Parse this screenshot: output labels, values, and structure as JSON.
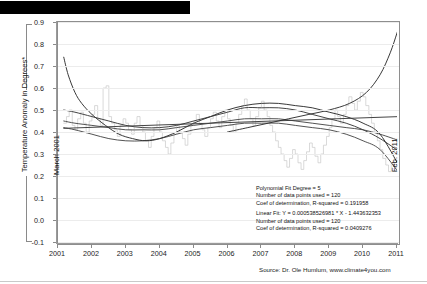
{
  "page": {
    "redaction_bar": "redacted-title-bar",
    "source_note": "Source: Dr. Ole Humlum, www.climate4you.com"
  },
  "chart_data": {
    "type": "line",
    "title": "",
    "xlabel": "",
    "ylabel": "Temperature Anomaly in Degrees*",
    "xlim": [
      2001,
      2011
    ],
    "ylim": [
      -0.1,
      0.9
    ],
    "grid": true,
    "legend_position": "inside-lower-right",
    "xticks": [
      "2001",
      "2002",
      "2003",
      "2004",
      "2005",
      "2006",
      "2007",
      "2008",
      "2009",
      "2010",
      "2011"
    ],
    "yticks": [
      "0.9",
      "0.8",
      "0.7",
      "0.6",
      "0.5",
      "0.4",
      "0.3",
      "0.2",
      "0.1",
      "0.0",
      "-0.1"
    ],
    "annotations": {
      "start_label": "March 2001",
      "end_label": "Feb. 2011"
    },
    "fit_info": {
      "polynomial": {
        "degree_line": "Polynomial Fit Degree = 5",
        "points_line": "Number of data points used = 120",
        "r2_line": "Coef of determination, R-squared = 0.191958"
      },
      "linear": {
        "equation_line": "Linear Fit: Y = 0.000538526981 * X - 1.443632353",
        "points_line": "Number of data points used = 120",
        "r2_line": "Coef of determination, R-squared = 0.0409276"
      }
    },
    "series": [
      {
        "name": "Monthly temperature anomaly",
        "style": "step",
        "color": "#c9c9c9",
        "x": [
          2001.17,
          2001.25,
          2001.33,
          2001.42,
          2001.5,
          2001.58,
          2001.67,
          2001.75,
          2001.83,
          2001.92,
          2002.0,
          2002.08,
          2002.17,
          2002.25,
          2002.33,
          2002.42,
          2002.5,
          2002.58,
          2002.67,
          2002.75,
          2002.83,
          2002.92,
          2003.0,
          2003.08,
          2003.17,
          2003.25,
          2003.33,
          2003.42,
          2003.5,
          2003.58,
          2003.67,
          2003.75,
          2003.83,
          2003.92,
          2004.0,
          2004.08,
          2004.17,
          2004.25,
          2004.33,
          2004.42,
          2004.5,
          2004.58,
          2004.67,
          2004.75,
          2004.83,
          2004.92,
          2005.0,
          2005.08,
          2005.17,
          2005.25,
          2005.33,
          2005.42,
          2005.5,
          2005.58,
          2005.67,
          2005.75,
          2005.83,
          2005.92,
          2006.0,
          2006.08,
          2006.17,
          2006.25,
          2006.33,
          2006.42,
          2006.5,
          2006.58,
          2006.67,
          2006.75,
          2006.83,
          2006.92,
          2007.0,
          2007.08,
          2007.17,
          2007.25,
          2007.33,
          2007.42,
          2007.5,
          2007.58,
          2007.67,
          2007.75,
          2007.83,
          2007.92,
          2008.0,
          2008.08,
          2008.17,
          2008.25,
          2008.33,
          2008.42,
          2008.5,
          2008.58,
          2008.67,
          2008.75,
          2008.83,
          2008.92,
          2009.0,
          2009.08,
          2009.17,
          2009.25,
          2009.33,
          2009.42,
          2009.5,
          2009.58,
          2009.67,
          2009.75,
          2009.83,
          2009.92,
          2010.0,
          2010.08,
          2010.17,
          2010.25,
          2010.33,
          2010.42,
          2010.5,
          2010.58,
          2010.67,
          2010.75,
          2010.83,
          2010.92,
          2011.0,
          2011.08
        ],
        "values": [
          0.44,
          0.47,
          0.5,
          0.43,
          0.41,
          0.46,
          0.49,
          0.44,
          0.4,
          0.45,
          0.48,
          0.52,
          0.46,
          0.43,
          0.6,
          0.61,
          0.47,
          0.44,
          0.41,
          0.38,
          0.43,
          0.46,
          0.44,
          0.41,
          0.39,
          0.44,
          0.47,
          0.43,
          0.4,
          0.36,
          0.33,
          0.38,
          0.42,
          0.45,
          0.4,
          0.36,
          0.33,
          0.3,
          0.35,
          0.39,
          0.43,
          0.4,
          0.37,
          0.34,
          0.39,
          0.43,
          0.45,
          0.48,
          0.44,
          0.41,
          0.38,
          0.42,
          0.46,
          0.49,
          0.45,
          0.42,
          0.47,
          0.5,
          0.46,
          0.43,
          0.4,
          0.44,
          0.48,
          0.52,
          0.55,
          0.5,
          0.46,
          0.43,
          0.47,
          0.51,
          0.54,
          0.5,
          0.47,
          0.43,
          0.4,
          0.36,
          0.33,
          0.3,
          0.27,
          0.24,
          0.28,
          0.32,
          0.3,
          0.26,
          0.23,
          0.27,
          0.31,
          0.35,
          0.33,
          0.29,
          0.26,
          0.3,
          0.34,
          0.38,
          0.42,
          0.46,
          0.5,
          0.47,
          0.44,
          0.48,
          0.52,
          0.56,
          0.53,
          0.5,
          0.54,
          0.58,
          0.56,
          0.52,
          0.48,
          0.44,
          0.4,
          0.36,
          0.32,
          0.28,
          0.25,
          0.22,
          0.26,
          0.24,
          0.22,
          0.2
        ]
      },
      {
        "name": "Polynomial fit (degree 5)",
        "style": "smooth",
        "color": "#3a3a3a",
        "x": [
          2001.17,
          2001.5,
          2002.0,
          2002.5,
          2003.0,
          2003.5,
          2004.0,
          2004.5,
          2005.0,
          2005.5,
          2006.0,
          2006.5,
          2007.0,
          2007.5,
          2008.0,
          2008.5,
          2009.0,
          2009.5,
          2010.0,
          2010.5,
          2011.08
        ],
        "values": [
          0.5,
          0.49,
          0.47,
          0.45,
          0.43,
          0.42,
          0.42,
          0.43,
          0.45,
          0.47,
          0.49,
          0.51,
          0.51,
          0.51,
          0.5,
          0.48,
          0.46,
          0.44,
          0.41,
          0.37,
          0.31
        ]
      },
      {
        "name": "Secondary smoothing curve",
        "style": "smooth",
        "color": "#4a4a4a",
        "x": [
          2001.17,
          2001.5,
          2002.0,
          2002.5,
          2003.0,
          2003.5,
          2004.0,
          2004.5,
          2005.0,
          2005.5,
          2006.0,
          2006.5,
          2007.0,
          2007.5,
          2008.0,
          2008.5,
          2009.0,
          2009.5,
          2010.0,
          2010.5,
          2011.08
        ],
        "values": [
          0.45,
          0.44,
          0.43,
          0.42,
          0.41,
          0.41,
          0.41,
          0.42,
          0.43,
          0.44,
          0.45,
          0.46,
          0.46,
          0.46,
          0.45,
          0.44,
          0.43,
          0.42,
          0.41,
          0.39,
          0.36
        ]
      },
      {
        "name": "Lower smoothing curve",
        "style": "smooth",
        "color": "#4a4a4a",
        "x": [
          2001.17,
          2001.5,
          2002.0,
          2002.5,
          2003.0,
          2003.5,
          2004.0,
          2004.5,
          2005.0,
          2005.5,
          2006.0,
          2006.5,
          2007.0,
          2007.5,
          2008.0,
          2008.5,
          2009.0,
          2009.5,
          2010.0,
          2010.5,
          2011.08
        ],
        "values": [
          0.42,
          0.41,
          0.39,
          0.37,
          0.36,
          0.36,
          0.37,
          0.39,
          0.41,
          0.42,
          0.43,
          0.44,
          0.44,
          0.44,
          0.43,
          0.42,
          0.41,
          0.39,
          0.36,
          0.32,
          0.21
        ]
      },
      {
        "name": "Steep descending curve",
        "style": "smooth",
        "color": "#2e2e2e",
        "x": [
          2001.17,
          2001.3,
          2001.5,
          2001.7,
          2002.0,
          2002.4,
          2002.8,
          2003.2,
          2003.6,
          2004.0,
          2004.5,
          2005.0,
          2005.5,
          2006.0,
          2006.5,
          2007.0,
          2007.5,
          2008.0,
          2008.5,
          2009.0,
          2009.5,
          2010.0,
          2010.5,
          2011.08
        ],
        "values": [
          0.74,
          0.66,
          0.58,
          0.53,
          0.48,
          0.43,
          0.39,
          0.37,
          0.36,
          0.37,
          0.4,
          0.44,
          0.47,
          0.5,
          0.52,
          0.53,
          0.53,
          0.52,
          0.51,
          0.49,
          0.47,
          0.44,
          0.39,
          0.24
        ]
      },
      {
        "name": "Linear fit",
        "style": "line",
        "color": "#3a3a3a",
        "x": [
          2001.17,
          2011.08
        ],
        "values": [
          0.4167,
          0.4701
        ]
      },
      {
        "name": "Rising right-edge curve",
        "style": "smooth",
        "color": "#2e2e2e",
        "x": [
          2006.0,
          2006.6,
          2007.2,
          2007.8,
          2008.4,
          2009.0,
          2009.6,
          2010.1,
          2010.5,
          2010.8,
          2011.0,
          2011.08
        ],
        "values": [
          0.4,
          0.42,
          0.44,
          0.46,
          0.48,
          0.5,
          0.53,
          0.58,
          0.66,
          0.76,
          0.85,
          0.89
        ]
      }
    ]
  }
}
